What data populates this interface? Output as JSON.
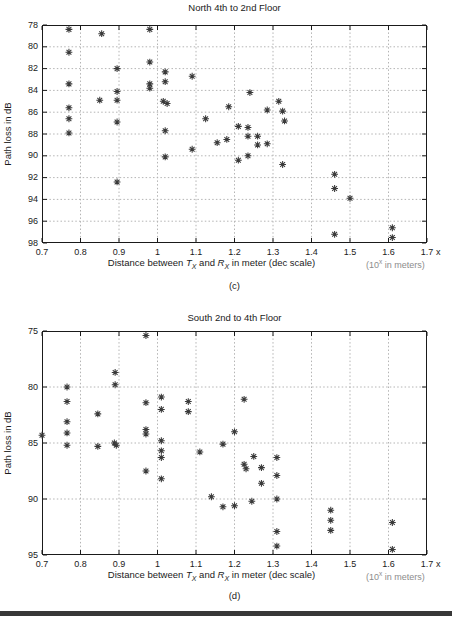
{
  "page": {
    "background": "#ffffff",
    "bottom_rule_color": "#383838"
  },
  "chart_data": [
    {
      "id": "c",
      "type": "scatter",
      "title": "North 4th to 2nd Floor",
      "caption": "(c)",
      "ylabel": "Path loss in dB",
      "xlabel_parts": {
        "pre": "Distance between ",
        "tx": "T",
        "tx_sub": "X",
        "mid": " and ",
        "rx": "R",
        "rx_sub": "X",
        "post": " in meter (dec scale)"
      },
      "x_unit_note_parts": {
        "pre": "(10",
        "sup": "x",
        "post": " in meters)"
      },
      "x_axis_suffix": "x",
      "x_ticks": [
        "0.7",
        "0.8",
        "0.9",
        "1",
        "1.1",
        "1.2",
        "1.3",
        "1.4",
        "1.5",
        "1.6",
        "1.7"
      ],
      "y_ticks": [
        "78",
        "80",
        "82",
        "84",
        "86",
        "88",
        "90",
        "92",
        "94",
        "96",
        "98"
      ],
      "xlim": [
        0.7,
        1.7
      ],
      "ylim": [
        78,
        98
      ],
      "y_axis_reversed": true,
      "grid": true,
      "legend": "none",
      "marker": "asterisk",
      "marker_color": "#3a3a3a",
      "grid_color": "#b4b4b4",
      "points": [
        [
          0.77,
          78.4
        ],
        [
          0.855,
          78.8
        ],
        [
          0.98,
          78.4
        ],
        [
          0.77,
          80.5
        ],
        [
          0.98,
          81.4
        ],
        [
          0.895,
          82.0
        ],
        [
          1.02,
          82.3
        ],
        [
          1.09,
          82.7
        ],
        [
          0.77,
          83.4
        ],
        [
          0.98,
          83.4
        ],
        [
          0.98,
          83.8
        ],
        [
          1.02,
          83.2
        ],
        [
          0.895,
          84.1
        ],
        [
          0.85,
          84.9
        ],
        [
          0.895,
          84.9
        ],
        [
          1.015,
          85.0
        ],
        [
          1.025,
          85.2
        ],
        [
          1.24,
          84.2
        ],
        [
          0.77,
          85.6
        ],
        [
          1.185,
          85.5
        ],
        [
          1.315,
          85.0
        ],
        [
          1.285,
          85.8
        ],
        [
          1.325,
          85.9
        ],
        [
          0.77,
          86.6
        ],
        [
          1.125,
          86.6
        ],
        [
          0.895,
          86.9
        ],
        [
          1.33,
          86.8
        ],
        [
          0.77,
          87.9
        ],
        [
          1.02,
          87.7
        ],
        [
          1.21,
          87.3
        ],
        [
          1.235,
          87.4
        ],
        [
          1.235,
          88.2
        ],
        [
          1.26,
          88.2
        ],
        [
          1.18,
          88.5
        ],
        [
          1.155,
          88.8
        ],
        [
          1.285,
          88.9
        ],
        [
          1.26,
          89.0
        ],
        [
          1.09,
          89.4
        ],
        [
          1.235,
          90.0
        ],
        [
          1.21,
          90.4
        ],
        [
          1.02,
          90.1
        ],
        [
          1.325,
          90.8
        ],
        [
          0.895,
          92.4
        ],
        [
          1.46,
          91.7
        ],
        [
          1.46,
          93.0
        ],
        [
          1.5,
          93.9
        ],
        [
          1.46,
          97.2
        ],
        [
          1.61,
          96.6
        ],
        [
          1.61,
          97.5
        ]
      ]
    },
    {
      "id": "d",
      "type": "scatter",
      "title": "South 2nd to 4th Floor",
      "caption": "(d)",
      "ylabel": "Path loss in dB",
      "xlabel_parts": {
        "pre": "Distance between ",
        "tx": "T",
        "tx_sub": "X",
        "mid": " and ",
        "rx": "R",
        "rx_sub": "X",
        "post": " in meter (dec scale)"
      },
      "x_unit_note_parts": {
        "pre": "(10",
        "sup": "x",
        "post": " in meters)"
      },
      "x_axis_suffix": "x",
      "x_ticks": [
        "0.7",
        "0.8",
        "0.9",
        "1",
        "1.1",
        "1.2",
        "1.3",
        "1.4",
        "1.5",
        "1.6",
        "1.7"
      ],
      "y_ticks": [
        "75",
        "80",
        "85",
        "90",
        "95"
      ],
      "xlim": [
        0.7,
        1.7
      ],
      "ylim": [
        75,
        95
      ],
      "y_axis_reversed": true,
      "grid": true,
      "legend": "none",
      "marker": "asterisk",
      "marker_color": "#3a3a3a",
      "grid_color": "#b4b4b4",
      "points": [
        [
          0.7,
          84.3
        ],
        [
          0.765,
          80.0
        ],
        [
          0.765,
          81.3
        ],
        [
          0.765,
          83.1
        ],
        [
          0.765,
          84.1
        ],
        [
          0.765,
          85.2
        ],
        [
          0.845,
          82.4
        ],
        [
          0.845,
          85.3
        ],
        [
          0.89,
          78.7
        ],
        [
          0.89,
          79.8
        ],
        [
          0.888,
          85.0
        ],
        [
          0.893,
          85.2
        ],
        [
          0.97,
          75.4
        ],
        [
          0.97,
          81.4
        ],
        [
          0.97,
          83.8
        ],
        [
          0.97,
          84.2
        ],
        [
          0.97,
          87.5
        ],
        [
          1.01,
          80.9
        ],
        [
          1.01,
          82.0
        ],
        [
          1.01,
          84.8
        ],
        [
          1.01,
          85.7
        ],
        [
          1.01,
          86.3
        ],
        [
          1.01,
          88.2
        ],
        [
          1.08,
          81.3
        ],
        [
          1.08,
          82.2
        ],
        [
          1.11,
          85.8
        ],
        [
          1.14,
          89.8
        ],
        [
          1.17,
          85.1
        ],
        [
          1.17,
          90.7
        ],
        [
          1.2,
          84.0
        ],
        [
          1.2,
          90.6
        ],
        [
          1.225,
          81.1
        ],
        [
          1.225,
          86.9
        ],
        [
          1.23,
          87.3
        ],
        [
          1.25,
          86.2
        ],
        [
          1.245,
          90.2
        ],
        [
          1.27,
          87.2
        ],
        [
          1.27,
          88.6
        ],
        [
          1.31,
          86.3
        ],
        [
          1.31,
          87.9
        ],
        [
          1.31,
          90.0
        ],
        [
          1.31,
          92.9
        ],
        [
          1.31,
          94.2
        ],
        [
          1.45,
          91.0
        ],
        [
          1.45,
          91.9
        ],
        [
          1.45,
          92.8
        ],
        [
          1.61,
          92.1
        ],
        [
          1.61,
          94.5
        ]
      ]
    }
  ]
}
